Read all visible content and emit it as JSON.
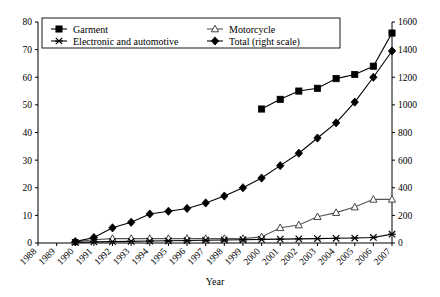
{
  "chart_data": {
    "type": "line",
    "title": "",
    "xlabel": "Year",
    "ylabel": "",
    "y2label": "",
    "grid": false,
    "legend_position": "top-inside",
    "categories": [
      "1988",
      "1989",
      "1990",
      "1991",
      "1992",
      "1993",
      "1994",
      "1995",
      "1996",
      "1997",
      "1998",
      "1999",
      "2000",
      "2001",
      "2002",
      "2003",
      "2004",
      "2005",
      "2006",
      "2007"
    ],
    "ylim": [
      0,
      80
    ],
    "yticks": [
      0,
      10,
      20,
      30,
      40,
      50,
      60,
      70,
      80
    ],
    "y2lim": [
      0,
      1600
    ],
    "y2ticks": [
      0,
      200,
      400,
      600,
      800,
      1000,
      1200,
      1400,
      1600
    ],
    "series": [
      {
        "name": "Garment",
        "marker": "filled-square",
        "axis": "left",
        "values": [
          null,
          null,
          null,
          null,
          null,
          null,
          null,
          null,
          null,
          null,
          null,
          null,
          48.5,
          52,
          55,
          56,
          59.5,
          61,
          64,
          76
        ]
      },
      {
        "name": "Motorcycle",
        "marker": "open-triangle",
        "axis": "left",
        "values": [
          null,
          null,
          0.4,
          1.2,
          1.6,
          1.6,
          1.6,
          1.6,
          1.6,
          1.6,
          1.6,
          1.6,
          2.2,
          5.5,
          6.5,
          9.5,
          11,
          13,
          15.8,
          15.8
        ]
      },
      {
        "name": "Electronic and automotive",
        "marker": "cross",
        "axis": "left",
        "values": [
          null,
          null,
          0.2,
          0.4,
          0.5,
          0.6,
          0.7,
          0.8,
          0.9,
          1.0,
          1.1,
          1.2,
          1.3,
          1.4,
          1.5,
          1.6,
          1.7,
          1.8,
          2.0,
          3.2
        ]
      },
      {
        "name": "Total (right scale)",
        "marker": "filled-diamond",
        "axis": "right",
        "values": [
          null,
          null,
          10,
          40,
          110,
          150,
          210,
          230,
          250,
          290,
          340,
          400,
          470,
          560,
          650,
          760,
          870,
          1020,
          1200,
          1390
        ]
      }
    ]
  },
  "legend": {
    "items": [
      {
        "label": "Garment",
        "marker": "filled-square"
      },
      {
        "label": "Motorcycle",
        "marker": "open-triangle"
      },
      {
        "label": "Electronic and automotive",
        "marker": "cross"
      },
      {
        "label": "Total (right scale)",
        "marker": "filled-diamond"
      }
    ]
  },
  "colors": {
    "series": "#000000",
    "motorcycle": "#555555",
    "axis": "#000000",
    "background": "#ffffff"
  }
}
